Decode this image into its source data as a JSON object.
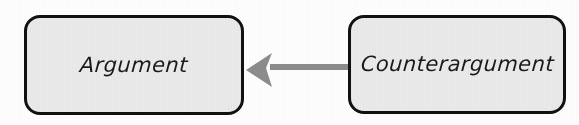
{
  "diagram": {
    "type": "flow",
    "background_color": "#fdfdfd",
    "nodes": [
      {
        "id": "argument",
        "label": "Argument",
        "fill_color": "#e9e9e9",
        "border_color": "#111111"
      },
      {
        "id": "counterargument",
        "label": "Counterargument",
        "fill_color": "#e9e9e9",
        "border_color": "#111111"
      }
    ],
    "edges": [
      {
        "id": "counterargument-to-argument",
        "from": "counterargument",
        "to": "argument",
        "label": "",
        "direction": "left",
        "color": "#8c8c8c",
        "arrowhead": "concave-swept"
      }
    ]
  }
}
